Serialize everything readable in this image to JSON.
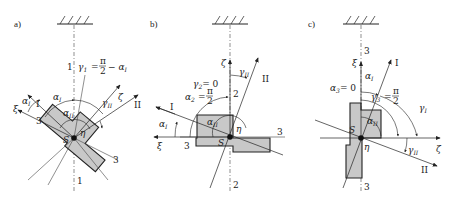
{
  "figure": {
    "panels": [
      {
        "id": "a",
        "label": "a)",
        "axis_labels": {
          "I": "I",
          "II": "II",
          "xi": "ξ",
          "eta": "η",
          "S": "S"
        },
        "line_labels": {
          "line1_top": "1",
          "line1_bottom": "1",
          "line3_left": "3",
          "line3_right": "3"
        },
        "angles": {
          "alpha1_outer": "α",
          "alpha1_outer_sub": "I",
          "alpha1_inner": "α",
          "alpha1_inner_sub": "I",
          "alphaII": "α",
          "alphaII_sub": "II",
          "gammaII": "γ",
          "gammaII_sub": "II",
          "gamma1_eq": "γ",
          "gamma1_sub": "1",
          "gamma1_rhs": "= π/2 − α",
          "gamma1_rhs_sub": "I",
          "pi": "π",
          "two": "2",
          "minus_alpha": "− α"
        }
      },
      {
        "id": "b",
        "label": "b)",
        "axis_labels": {
          "I": "I",
          "II": "II",
          "xi": "ξ",
          "zeta": "ζ",
          "eta": "η",
          "S": "S"
        },
        "line_labels": {
          "line2_top": "2",
          "line2_bottom": "2",
          "line3_left": "3",
          "line3_right": "3"
        },
        "angles": {
          "gamma2": "γ",
          "gamma2_sub": "2",
          "gamma2_val": "= 0",
          "gammaII": "γ",
          "gammaII_sub": "II",
          "alpha2": "α",
          "alpha2_sub": "2",
          "alpha2_eq": "=",
          "pi": "π",
          "two": "2",
          "alpha1": "α",
          "alpha1_sub": "I",
          "alphaII": "α",
          "alphaII_sub": "II"
        }
      },
      {
        "id": "c",
        "label": "c)",
        "axis_labels": {
          "I": "I",
          "II": "II",
          "xi": "ξ",
          "zeta": "ζ",
          "eta": "η",
          "S": "S"
        },
        "line_labels": {
          "line3_top": "3",
          "line3_bottom": "3"
        },
        "angles": {
          "alpha3": "α",
          "alpha3_sub": "3",
          "alpha3_val": "= 0",
          "alpha1": "α",
          "alpha1_sub": "I",
          "gamma3": "γ",
          "gamma3_sub": "3",
          "gamma3_eq": "=",
          "pi": "π",
          "two": "2",
          "gammaI": "γ",
          "gammaI_sub": "I",
          "alphaII": "α",
          "alphaII_sub": "II",
          "gammaII": "γ",
          "gammaII_sub": "II"
        }
      }
    ]
  }
}
